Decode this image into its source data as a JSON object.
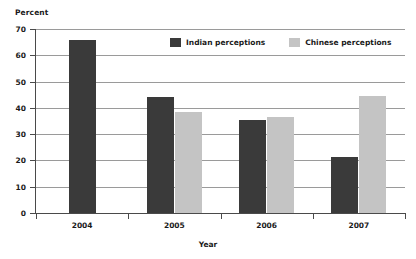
{
  "chart_data": {
    "type": "bar",
    "title": "",
    "subtitle": "",
    "xlabel": "Year",
    "ylabel": "Percent",
    "categories": [
      "2004",
      "2005",
      "2006",
      "2007"
    ],
    "series": [
      {
        "name": "Indian perceptions",
        "color": "#3a3a3a",
        "values": [
          66,
          44,
          35.5,
          21.5
        ]
      },
      {
        "name": "Chinese perceptions",
        "color": "#c4c4c4",
        "values": [
          null,
          38.5,
          36.5,
          44.5
        ]
      }
    ],
    "ylim": [
      0,
      70
    ],
    "ytick_labels": [
      "70",
      "60",
      "50",
      "40",
      "30",
      "20",
      "10",
      "0"
    ],
    "ytick_values": [
      70,
      60,
      50,
      40,
      30,
      20,
      10,
      0
    ],
    "grid": true,
    "legend_position": "top-center"
  },
  "legend": {
    "entries": [
      {
        "label": "Indian perceptions",
        "swatch": "indian"
      },
      {
        "label": "Chinese perceptions",
        "swatch": "chinese"
      }
    ]
  },
  "axes": {
    "y_title": "Percent",
    "x_title": "Year"
  }
}
